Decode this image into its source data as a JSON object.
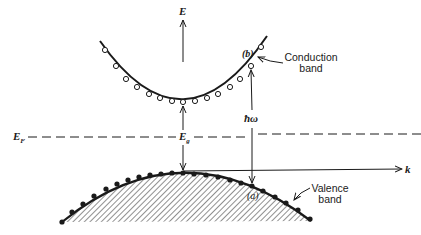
{
  "diagram": {
    "type": "band-structure",
    "axes": {
      "vertical": {
        "label": "E"
      },
      "horizontal": {
        "label": "k"
      }
    },
    "levels": {
      "fermi": {
        "label": "E",
        "subscript": "F",
        "style": "dashed"
      },
      "gap": {
        "label": "E",
        "subscript": "g"
      }
    },
    "bands": {
      "conduction": {
        "label_line1": "Conduction",
        "label_line2": "band",
        "marker": "open-circle"
      },
      "valence": {
        "label_line1": "Valence",
        "label_line2": "band",
        "marker": "filled-circle",
        "fill": "hatched"
      }
    },
    "transition": {
      "label": "ħω",
      "start_point": "(a)",
      "end_point": "(b)"
    },
    "colors": {
      "ink": "#1a1a1a",
      "background": "#ffffff"
    }
  }
}
